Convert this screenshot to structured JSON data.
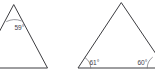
{
  "figure": {
    "background_color": "#ffffff",
    "stroke_color": "#3c3c40",
    "label_color": "#42424a",
    "stroke_width": 1,
    "canvas": {
      "width": 155,
      "height": 76
    }
  },
  "shapes": [
    {
      "id": "left-triangle",
      "name": "left-triangle",
      "type": "triangle",
      "clipped": "left edge of image",
      "vertices": [
        {
          "name": "apex",
          "x": 13.5,
          "y": 5.0
        },
        {
          "name": "bottom-left",
          "x": -20.0,
          "y": 68.0
        },
        {
          "name": "bottom-right",
          "x": 47.0,
          "y": 68.0
        }
      ],
      "path": "M 13.5 5 L -20 68 L 47 68 Z",
      "angles": [
        {
          "id": "left-apex-angle",
          "name": "angle-label-59",
          "value": 59,
          "unit": "degrees",
          "text": "59°",
          "label_x": 14.5,
          "label_y": 29.5,
          "arc": "M 6.6 21.5 A 18 18 0 0 1 21.2 20.8",
          "at_vertex": "apex"
        }
      ]
    },
    {
      "id": "right-triangle",
      "name": "right-triangle",
      "type": "triangle",
      "clipped": "right edge of image",
      "vertices": [
        {
          "name": "apex",
          "x": 121.0,
          "y": 3.0
        },
        {
          "name": "bottom-left",
          "x": 78.0,
          "y": 68.0
        },
        {
          "name": "bottom-right",
          "x": 165.0,
          "y": 68.0
        }
      ],
      "path": "M 121 3 L 78 68 L 165 68 Z",
      "angles": [
        {
          "id": "right-bottom-left-angle",
          "name": "angle-label-61",
          "value": 61,
          "unit": "degrees",
          "text": "61°",
          "label_x": 89.5,
          "label_y": 65.0,
          "arc": "M 90.8 68 A 13 13 0 0 0 85.0 57.6",
          "at_vertex": "bottom-left"
        },
        {
          "id": "right-bottom-right-angle",
          "name": "angle-label-60",
          "value": 60,
          "unit": "degrees",
          "text": "60°",
          "label_x": 137.5,
          "label_y": 65.0,
          "arc": "M 147.2 68 A 13 13 0 0 1 152.4 57.4",
          "at_vertex": "bottom-right"
        }
      ]
    }
  ]
}
